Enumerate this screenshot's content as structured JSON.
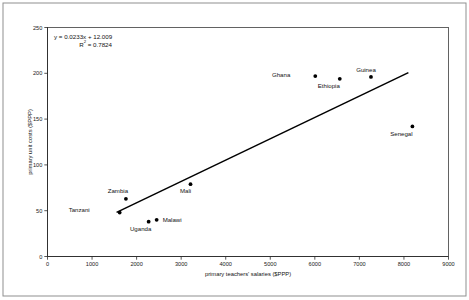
{
  "chart_data": {
    "type": "scatter",
    "title": "",
    "xlabel": "primary teachers' salaries ($PPP)",
    "ylabel": "primary unit costs ($PPP)",
    "xlim": [
      0,
      9000
    ],
    "ylim": [
      0,
      250
    ],
    "xticks": [
      0,
      1000,
      2000,
      3000,
      4000,
      5000,
      6000,
      7000,
      8000,
      9000
    ],
    "yticks": [
      0,
      50,
      100,
      150,
      200,
      250
    ],
    "xtick_labels": [
      "0",
      "1000",
      "2000",
      "3000",
      "4000",
      "5000",
      "6000",
      "7000",
      "8000",
      "9000"
    ],
    "ytick_labels": [
      "0",
      "50",
      "100",
      "150",
      "200",
      "250"
    ],
    "grid": false,
    "legend": false,
    "points": [
      {
        "label": "Tanzani",
        "x": 1620,
        "y": 48,
        "label_dx": -30,
        "label_dy": -1
      },
      {
        "label": "Zambia",
        "x": 1760,
        "y": 63,
        "label_dx": -8,
        "label_dy": -6
      },
      {
        "label": "Uganda",
        "x": 2270,
        "y": 38,
        "label_dx": -8,
        "label_dy": 9
      },
      {
        "label": "Malawi",
        "x": 2450,
        "y": 40,
        "label_dx": 6,
        "label_dy": 2
      },
      {
        "label": "Mali",
        "x": 3210,
        "y": 79,
        "label_dx": -5,
        "label_dy": 9
      },
      {
        "label": "Ghana",
        "x": 6010,
        "y": 197,
        "label_dx": -25,
        "label_dy": 1
      },
      {
        "label": "Ethiopia",
        "x": 6560,
        "y": 194,
        "label_dx": -11,
        "label_dy": 9
      },
      {
        "label": "Guinea",
        "x": 7260,
        "y": 196,
        "label_dx": -5,
        "label_dy": -5
      },
      {
        "label": "Senegal",
        "x": 8190,
        "y": 142,
        "label_dx": -11,
        "label_dy": 10
      }
    ],
    "trendline": {
      "slope": 0.0233,
      "intercept": 12.009,
      "r_squared": 0.7824,
      "equation_label": "y = 0.0233x + 12.009",
      "r2_label": "R2 = 0.7824",
      "r2_prefix": "R",
      "r2_superscript": "2",
      "r2_suffix": " = 0.7824",
      "x_start": 1550,
      "x_end": 8100
    },
    "colors": {
      "marker": "#000000",
      "trendline": "#000000",
      "axis": "#2b2b2b",
      "frame": "#3c3c3c",
      "background": "#ffffff",
      "text": "#111111"
    }
  }
}
